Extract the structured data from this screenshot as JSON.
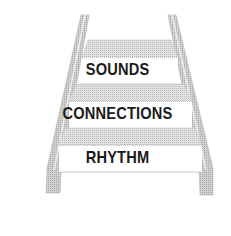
{
  "diagram": {
    "type": "staircase",
    "steps": [
      {
        "label": "SOUNDS",
        "level": 3
      },
      {
        "label": "CONNECTIONS",
        "level": 2
      },
      {
        "label": "RHYTHM",
        "level": 1
      }
    ]
  },
  "colors": {
    "background": "#ffffff",
    "tread": "#dcdcdc",
    "rail": "#cfcfcf",
    "edge": "#a8a8a8",
    "text": "#1a1a1a"
  }
}
